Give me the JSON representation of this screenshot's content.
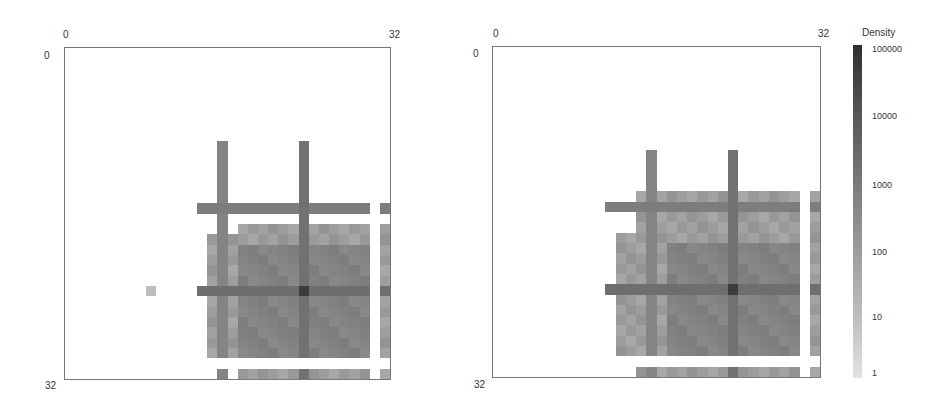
{
  "chart_data": [
    {
      "type": "heatmap",
      "title": "",
      "xlabel": "",
      "ylabel": "",
      "x_ticks": [
        "0",
        "32"
      ],
      "y_ticks": [
        "0",
        "32"
      ],
      "shape": [
        32,
        32
      ],
      "scale": "log",
      "colorbar": {
        "label": "Density",
        "ticks": [
          "100000",
          "10000",
          "1000",
          "100",
          "10",
          "1"
        ]
      },
      "description": "Sparse matrix density; nonzero block in lower-right (rows ~8-31, cols ~14-31); strong bands at row 23 and column 23 (peak at 23,23), secondary horizontal band at row 15, vertical band at column 15; empty row 30 and empty column 30.",
      "bands": {
        "rows": [
          15,
          23
        ],
        "cols": [
          15,
          23
        ],
        "peak": [
          23,
          23
        ],
        "empty_rows": [
          30
        ],
        "empty_cols": [
          30
        ]
      }
    },
    {
      "type": "heatmap",
      "title": "",
      "xlabel": "",
      "ylabel": "",
      "x_ticks": [
        "0",
        "32"
      ],
      "y_ticks": [
        "0",
        "32"
      ],
      "shape": [
        32,
        32
      ],
      "scale": "log",
      "colorbar": {
        "label": "Density",
        "ticks": [
          "100000",
          "10000",
          "1000",
          "100",
          "10",
          "1"
        ]
      },
      "description": "Similar density pattern; nonzero block rows ~10-31, cols ~10-31; strong horizontal bands at rows 15 and 23, vertical bands at columns 15 and 23 (peak at 23,23); empty row 30 and empty column 30.",
      "bands": {
        "rows": [
          15,
          23
        ],
        "cols": [
          15,
          23
        ],
        "peak": [
          23,
          23
        ],
        "empty_rows": [
          30
        ],
        "empty_cols": [
          30
        ]
      }
    }
  ],
  "left": {
    "x_start": "0",
    "x_end": "32",
    "y_start": "0",
    "y_end": "32"
  },
  "right": {
    "x_start": "0",
    "x_end": "32",
    "y_start": "0",
    "y_end": "32"
  },
  "colorbar": {
    "label": "Density",
    "ticks": [
      "100000",
      "10000",
      "1000",
      "100",
      "10",
      "1"
    ]
  }
}
